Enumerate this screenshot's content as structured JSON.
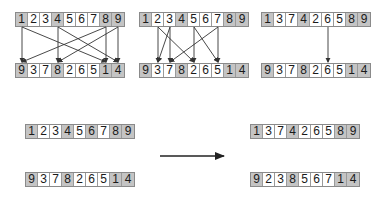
{
  "colors": {
    "shaded_cell": "#c4c4c4",
    "white_cell": "#ffffff",
    "line": "#333333"
  },
  "panels": [
    {
      "id": "panel-1",
      "top": {
        "values": [
          "1",
          "2",
          "3",
          "4",
          "5",
          "6",
          "7",
          "8",
          "9"
        ],
        "shaded": [
          true,
          false,
          false,
          true,
          false,
          false,
          false,
          true,
          true
        ]
      },
      "bottom": {
        "values": [
          "9",
          "3",
          "7",
          "8",
          "2",
          "6",
          "5",
          "1",
          "4"
        ],
        "shaded": [
          true,
          false,
          false,
          true,
          false,
          false,
          false,
          true,
          true
        ]
      },
      "links": [
        [
          0,
          7
        ],
        [
          0,
          0
        ],
        [
          3,
          3
        ],
        [
          3,
          8
        ],
        [
          7,
          7
        ],
        [
          7,
          0
        ],
        [
          8,
          8
        ],
        [
          8,
          3
        ]
      ]
    },
    {
      "id": "panel-2",
      "top": {
        "values": [
          "1",
          "2",
          "3",
          "4",
          "5",
          "6",
          "7",
          "8",
          "9"
        ],
        "shaded": [
          true,
          false,
          false,
          true,
          false,
          false,
          false,
          true,
          true
        ]
      },
      "bottom": {
        "values": [
          "9",
          "3",
          "7",
          "8",
          "2",
          "6",
          "5",
          "1",
          "4"
        ],
        "shaded": [
          true,
          false,
          false,
          true,
          false,
          false,
          false,
          true,
          true
        ]
      },
      "links": [
        [
          1,
          1
        ],
        [
          1,
          4
        ],
        [
          2,
          1
        ],
        [
          2,
          2
        ],
        [
          4,
          4
        ],
        [
          4,
          6
        ],
        [
          6,
          2
        ],
        [
          6,
          6
        ]
      ]
    },
    {
      "id": "panel-3",
      "top": {
        "values": [
          "1",
          "3",
          "7",
          "4",
          "2",
          "6",
          "5",
          "8",
          "9"
        ],
        "shaded": [
          true,
          false,
          false,
          true,
          false,
          false,
          false,
          true,
          true
        ]
      },
      "bottom": {
        "values": [
          "9",
          "3",
          "7",
          "8",
          "2",
          "6",
          "5",
          "1",
          "4"
        ],
        "shaded": [
          true,
          false,
          false,
          true,
          false,
          false,
          false,
          true,
          true
        ]
      },
      "links": [
        [
          5,
          5
        ]
      ]
    }
  ],
  "transform": {
    "before": {
      "parent1": {
        "values": [
          "1",
          "2",
          "3",
          "4",
          "5",
          "6",
          "7",
          "8",
          "9"
        ],
        "shaded": [
          true,
          false,
          false,
          true,
          false,
          true,
          false,
          true,
          true
        ]
      },
      "parent2": {
        "values": [
          "9",
          "3",
          "7",
          "8",
          "2",
          "6",
          "5",
          "1",
          "4"
        ],
        "shaded": [
          true,
          false,
          false,
          true,
          false,
          false,
          false,
          true,
          true
        ]
      }
    },
    "after": {
      "child1": {
        "values": [
          "1",
          "3",
          "7",
          "4",
          "2",
          "6",
          "5",
          "8",
          "9"
        ],
        "shaded": [
          true,
          false,
          false,
          true,
          false,
          false,
          false,
          true,
          true
        ]
      },
      "child2": {
        "values": [
          "9",
          "2",
          "3",
          "8",
          "5",
          "6",
          "7",
          "1",
          "4"
        ],
        "shaded": [
          true,
          false,
          false,
          true,
          false,
          false,
          false,
          true,
          true
        ]
      }
    },
    "arrow": "right-arrow"
  }
}
